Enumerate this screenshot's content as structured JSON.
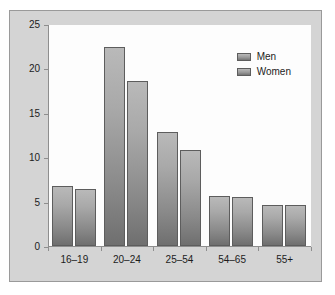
{
  "chart_data": {
    "type": "bar",
    "title": "",
    "subtitle": "",
    "xlabel": "",
    "ylabel": "",
    "categories": [
      "16–19",
      "20–24",
      "25–54",
      "54–65",
      "55+"
    ],
    "series": [
      {
        "name": "Men",
        "values": [
          6.8,
          22.5,
          12.9,
          5.7,
          4.6
        ]
      },
      {
        "name": "Women",
        "values": [
          6.4,
          18.7,
          10.9,
          5.5,
          4.6
        ]
      }
    ],
    "ylim": [
      0,
      25
    ],
    "yticks": [
      0,
      5,
      10,
      15,
      20,
      25
    ],
    "ytick_labels": [
      "0",
      "5",
      "10",
      "15",
      "20",
      "25"
    ],
    "grid": false,
    "legend_position": "top-right",
    "colors": {
      "bar_top": "#b9b9b9",
      "bar_bottom": "#6f6f6f",
      "bar_outline": "#5d5d5d",
      "figure_background": "#d4d4d4",
      "plot_background": "#fdfdfd",
      "axis": "#8e8e8e",
      "text": "#1c1c1c",
      "figure_border": "#9a9a9a"
    }
  }
}
